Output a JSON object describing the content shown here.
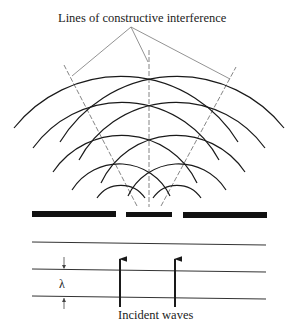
{
  "diagram": {
    "title": "Lines of constructive interference",
    "incident_label": "Incident waves",
    "wavelength_label": "λ",
    "colors": {
      "ink": "#1a1a1a",
      "construction": "#777777"
    },
    "sources": [
      {
        "x": 121,
        "y": 214
      },
      {
        "x": 177,
        "y": 214
      }
    ],
    "wavelength_px": 27,
    "arc_radii": [
      29,
      56,
      83,
      110,
      137
    ],
    "barrier_segments": [
      {
        "x1": 32,
        "x2": 116
      },
      {
        "x1": 126,
        "x2": 172
      },
      {
        "x1": 183,
        "x2": 267
      }
    ],
    "incident_wavefronts_y": [
      243,
      270,
      297
    ],
    "incident_arrows_x": [
      120,
      175
    ],
    "elements": [
      "double-slit barrier",
      "circular wavefronts",
      "lines of constructive interference",
      "incident plane waves",
      "wavelength marker"
    ]
  }
}
